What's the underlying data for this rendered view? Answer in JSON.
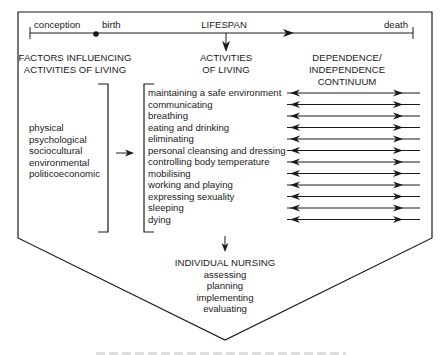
{
  "timeline": {
    "start_label": "conception",
    "birth_label": "birth",
    "title": "LIFESPAN",
    "end_label": "death"
  },
  "headers": {
    "factors_line1": "FACTORS INFLUENCING",
    "factors_line2": "ACTIVITIES OF LIVING",
    "activities_line1": "ACTIVITIES",
    "activities_line2": "OF LIVING",
    "continuum_line1": "DEPENDENCE/",
    "continuum_line2": "INDEPENDENCE",
    "continuum_line3": "CONTINUUM"
  },
  "factors": [
    "physical",
    "psychological",
    "sociocultural",
    "environmental",
    "politicoeconomic"
  ],
  "activities": [
    "maintaining a safe environment",
    "communicating",
    "breathing",
    "eating and drinking",
    "eliminating",
    "personal cleansing and dressing",
    "controlling body temperature",
    "mobilising",
    "working and playing",
    "expressing sexuality",
    "sleeping",
    "dying"
  ],
  "nursing": {
    "title": "INDIVIDUAL NURSING",
    "steps": [
      "assessing",
      "planning",
      "implementing",
      "evaluating"
    ]
  },
  "colors": {
    "line": "#1a1a1a",
    "background": "#ffffff"
  }
}
